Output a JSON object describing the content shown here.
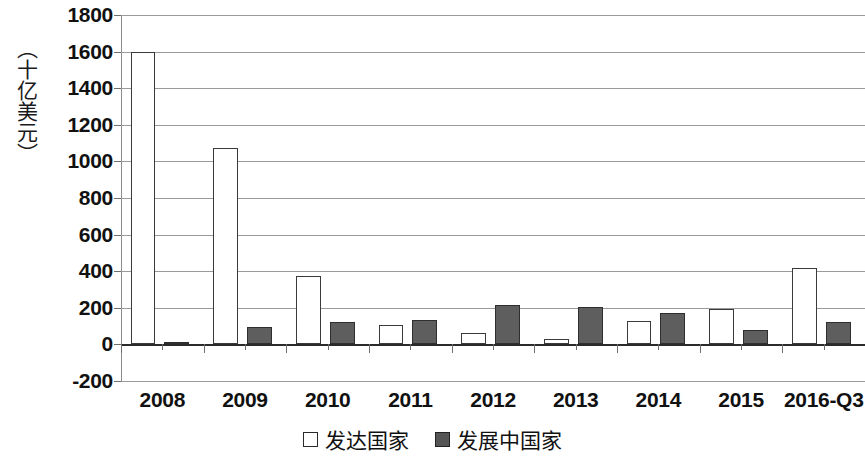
{
  "chart_data": {
    "type": "bar",
    "title": "",
    "xlabel": "",
    "ylabel": "（十亿美元）",
    "ylim": [
      -200,
      1800
    ],
    "ytick_step": 200,
    "ytick_labels": [
      "1800",
      "1600",
      "1400",
      "1200",
      "1000",
      "800",
      "600",
      "400",
      "200",
      "0",
      "-200"
    ],
    "grid": true,
    "legend_position": "bottom-center",
    "categories": [
      "2008",
      "2009",
      "2010",
      "2011",
      "2012",
      "2013",
      "2014",
      "2015",
      "2016-Q3"
    ],
    "series": [
      {
        "name": "发达国家",
        "color": "#ffffff",
        "values": [
          1600,
          1075,
          375,
          105,
          65,
          30,
          130,
          195,
          415
        ]
      },
      {
        "name": "发展中国家",
        "color": "#5e5e5e",
        "values": [
          5,
          95,
          125,
          135,
          215,
          205,
          170,
          80,
          120
        ]
      }
    ]
  },
  "legend": {
    "items": [
      {
        "label": "发达国家",
        "marker": "open-square"
      },
      {
        "label": "发展中国家",
        "marker": "filled-square"
      }
    ]
  }
}
